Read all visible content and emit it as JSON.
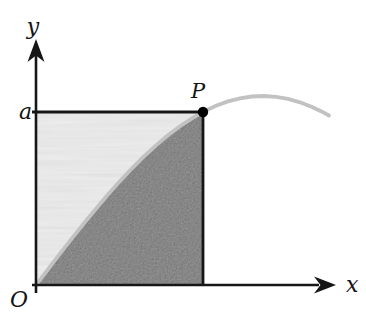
{
  "figure": {
    "type": "math-diagram",
    "labels": {
      "y_axis": "y",
      "x_axis": "x",
      "ordinate_a": "a",
      "origin": "O",
      "point_p": "P"
    },
    "colors": {
      "background": "#ffffff",
      "axes_and_square": "#161616",
      "curve": "#c2c2c2",
      "region_under_curve": "#a9a9a9",
      "region_above_curve": "#f3f3f3",
      "point_marker": "#000000"
    }
  }
}
